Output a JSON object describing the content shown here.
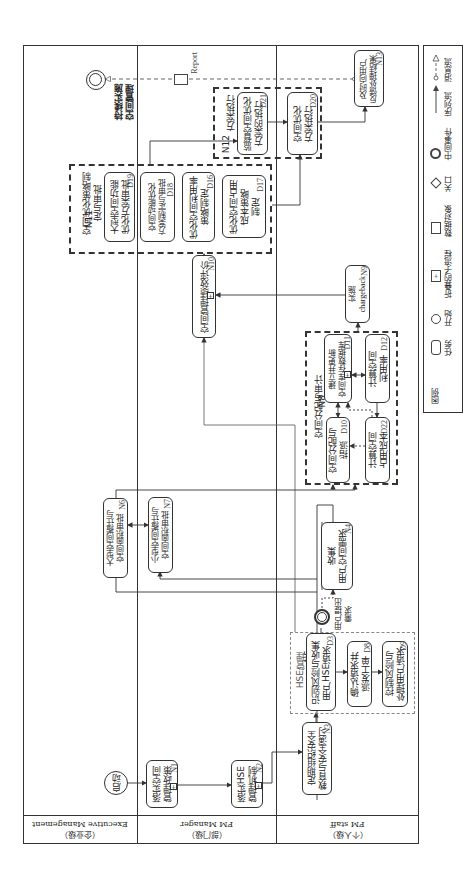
{
  "lanes": [
    {
      "en": "Executive Management",
      "cn": "（企业级）"
    },
    {
      "en": "FM Manager",
      "cn": "（部门级）"
    },
    {
      "en": "FM staff",
      "cn": "（个人级）"
    }
  ],
  "events": {
    "start": {
      "label": "启动"
    },
    "user_request": {
      "label": "用户提出\n需求"
    },
    "end": {
      "label": "持续实施\n空间管理"
    }
  },
  "data_object": {
    "label": "Report"
  },
  "tasks": {
    "N1": {
      "text": "落实空间\n管理政策",
      "id": "N1"
    },
    "N2": {
      "text": "落实HSE\n管理机制",
      "id": "N2"
    },
    "N3": {
      "text": "定期组织安全\n教育与安全演习",
      "id": "N3"
    },
    "N4": {
      "text": "收集\n用户空间需求",
      "id": "N4"
    },
    "N6": {
      "text": "大型空间搬迁与\n空间面积审批",
      "id": "N6"
    },
    "N7": {
      "text": "小型空间搬迁与\n空间面积审批",
      "id": "N7"
    },
    "N9": {
      "text": "实施\nchargeback",
      "id": "N9"
    },
    "N10": {
      "text": "空间管理绩效评价",
      "id": "N10"
    },
    "N13": {
      "text": "及时向用户\n反馈处理结果",
      "id": "N13"
    },
    "D3": {
      "text": "识别风险与收集\n用户HSE请求",
      "id": "D3"
    },
    "D8": {
      "text": "确认请求并\n派发工单",
      "id": "D8"
    },
    "D9": {
      "text": "控制风险与\n处理用户请求",
      "id": "D9"
    },
    "D10": {
      "text": "空间分配与\n指派",
      "id": "D10"
    },
    "D11": {
      "text": "建立并更新\n空间库存数据库",
      "id": "D11"
    },
    "D12": {
      "text": "计算空间\n利用率",
      "id": "D12"
    },
    "D22": {
      "text": "计算空间\n占用成本",
      "id": "D22"
    },
    "D16": {
      "text": "优化空间利用率\n策略制定",
      "id": "D16"
    },
    "D17": {
      "text": "优化空间占用\n成本策略\n制定",
      "id": "D17"
    },
    "D18": {
      "text": "空间动能优化\n方案制定与审批",
      "id": "D18"
    },
    "D19": {
      "text": "大型空间功能\n优化方案审批",
      "id": "D19"
    },
    "D20": {
      "text": "空间优化\n方案执行",
      "id": "D20"
    },
    "D21": {
      "text": "监督空间优化\n方案的执行",
      "id": "D21"
    }
  },
  "groups": {
    "N5": {
      "id": "N5",
      "title": "HSE管理"
    },
    "N8": {
      "id": "N8",
      "title": "空间分配与审计"
    },
    "N11": {
      "id": "N11",
      "title": "空间优化策略制\n定与审批"
    },
    "N12": {
      "id": "N12",
      "title": "方案执行"
    }
  },
  "legend": {
    "title": "图例",
    "items": [
      {
        "symbol": "task",
        "label": "任务"
      },
      {
        "symbol": "start",
        "label": "开始"
      },
      {
        "symbol": "collapsed-subprocess",
        "label": "折叠的子流程"
      },
      {
        "symbol": "data-object",
        "label": "数据对象"
      },
      {
        "symbol": "gateway",
        "label": "关口"
      },
      {
        "symbol": "intermediate-event",
        "label": "中间事件"
      },
      {
        "symbol": "sequence-flow",
        "label": "序列流"
      },
      {
        "symbol": "message-flow",
        "label": "消息流"
      }
    ]
  }
}
